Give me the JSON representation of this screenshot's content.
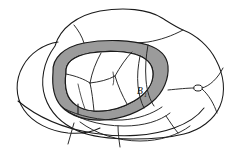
{
  "figure": {
    "title": "",
    "kind": "topological-region-diagram",
    "canvas": {
      "width": 233,
      "height": 157,
      "background": "#ffffff"
    },
    "colors": {
      "ink": "#1a1a1a",
      "annulus_gray": "#9b9b9b",
      "interior_white": "#ffffff",
      "page_white": "#ffffff"
    },
    "labels": [
      {
        "id": "region-b1",
        "text": "B",
        "subscript": "1",
        "x": 139,
        "y": 94
      }
    ],
    "nodes": [
      {
        "id": "boundary-node-right",
        "cx": 198,
        "cy": 88,
        "rx": 4.2,
        "ry": 3.0
      }
    ],
    "regions": [
      {
        "id": "outer-blob",
        "role": "outer-boundary",
        "fill": "#ffffff"
      },
      {
        "id": "left-lobe",
        "role": "outer-boundary-lobe",
        "fill": "#ffffff"
      },
      {
        "id": "bottom-lobe",
        "role": "outer-boundary-lobe",
        "fill": "#ffffff"
      },
      {
        "id": "annulus",
        "role": "shaded-annulus",
        "fill": "#9b9b9b"
      },
      {
        "id": "inner-disk",
        "role": "interior-disk",
        "fill": "#ffffff"
      }
    ],
    "tick_marks": [
      {
        "id": "tick-lower-left",
        "x1": 78,
        "y1": 104,
        "x2": 78,
        "y2": 114
      },
      {
        "id": "tick-inner-right",
        "x1": 112,
        "y1": 72,
        "x2": 113,
        "y2": 84
      }
    ],
    "tree_edges": 6
  }
}
